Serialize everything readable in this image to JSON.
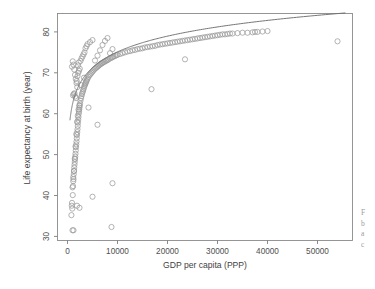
{
  "figure": {
    "background_color": "#ffffff",
    "point_color": "#9a9a9a",
    "curve_color": "#6f6f6f",
    "axis_color": "#7d7d7d"
  },
  "caption_fragment": {
    "line1": "F",
    "line2": "b",
    "line3": "a",
    "line4": "c"
  },
  "chart_data": {
    "type": "scatter",
    "title": "",
    "xlabel": "GDP per capita (PPP)",
    "ylabel": "Life expectancy at birth (year)",
    "xlim": [
      -2000,
      57000
    ],
    "ylim": [
      29,
      84.5
    ],
    "xticks": [
      0,
      10000,
      20000,
      30000,
      40000,
      50000
    ],
    "xtick_labels": [
      "0",
      "10000",
      "20000",
      "30000",
      "40000",
      "50000"
    ],
    "yticks": [
      30,
      40,
      50,
      60,
      70,
      80
    ],
    "ytick_labels": [
      "30",
      "40",
      "50",
      "60",
      "70",
      "80"
    ],
    "grid": false,
    "legend": null,
    "marker": "open-circle",
    "marker_size": 2.6,
    "series": [
      {
        "name": "Countries",
        "x": [
          780,
          850,
          900,
          950,
          1000,
          1050,
          1100,
          1150,
          1200,
          1250,
          1300,
          1350,
          1400,
          1450,
          1500,
          1550,
          1600,
          1650,
          1700,
          1750,
          1800,
          1850,
          1900,
          1950,
          2000,
          2050,
          2100,
          2150,
          2200,
          2250,
          2300,
          2350,
          2400,
          2450,
          2500,
          2600,
          2700,
          2800,
          2900,
          3000,
          3100,
          3200,
          3300,
          3400,
          3500,
          3600,
          3700,
          3800,
          3900,
          4000,
          4200,
          4400,
          4600,
          4800,
          5000,
          5200,
          5400,
          5600,
          5800,
          6000,
          6200,
          6400,
          6600,
          6800,
          7000,
          7200,
          7400,
          7600,
          7800,
          8000,
          8200,
          8500,
          8800,
          9000,
          9200,
          9500,
          9800,
          10000,
          10500,
          11000,
          11500,
          12000,
          12500,
          13000,
          13500,
          14000,
          14500,
          15000,
          15500,
          16000,
          16500,
          17000,
          17500,
          18000,
          18500,
          19000,
          19500,
          20000,
          20500,
          21000,
          21500,
          22000,
          22500,
          23000,
          23500,
          24000,
          24500,
          25000,
          25500,
          26000,
          26500,
          27000,
          27500,
          28000,
          28500,
          29000,
          29500,
          30000,
          30500,
          31000,
          31500,
          32000,
          32500,
          33000,
          34000,
          35000,
          36000,
          37000,
          37500,
          38000,
          39000,
          40000,
          54000,
          1100,
          1250,
          1400,
          1550,
          1700,
          1850,
          2000,
          2150,
          2300,
          2450,
          1000,
          1150,
          1300,
          1450,
          1600,
          1750,
          1900,
          2050,
          2200,
          2350,
          900,
          1050,
          1200,
          1350,
          1500,
          1650,
          1800,
          1950,
          2100,
          2250,
          2600,
          2800,
          3000,
          3200,
          3400,
          3600,
          3800,
          4000,
          4500,
          5000,
          5500,
          6000,
          6500,
          7000,
          7500,
          8000,
          8500,
          9000,
          1200,
          8800,
          5000,
          9000,
          16800,
          23500,
          6000,
          4200,
          2700,
          3300,
          2400,
          1900
        ],
        "y": [
          35.2,
          37.5,
          38.2,
          36.8,
          31.5,
          40.1,
          42.3,
          43.5,
          44.0,
          45.2,
          46.0,
          46.8,
          47.5,
          48.2,
          48.9,
          49.5,
          50.2,
          51.0,
          51.8,
          52.5,
          53.2,
          54.0,
          54.8,
          55.5,
          56.2,
          57.0,
          57.8,
          58.5,
          59.2,
          60.0,
          60.5,
          61.0,
          61.5,
          62.0,
          62.5,
          63.2,
          63.8,
          64.3,
          64.8,
          65.2,
          65.6,
          66.0,
          66.4,
          66.8,
          67.1,
          67.4,
          67.7,
          68.0,
          68.3,
          68.6,
          69.0,
          69.4,
          69.7,
          70.0,
          70.3,
          70.6,
          70.9,
          71.1,
          71.3,
          71.5,
          71.7,
          71.9,
          72.1,
          72.3,
          72.4,
          72.6,
          72.7,
          72.9,
          73.0,
          73.1,
          73.3,
          73.5,
          73.7,
          73.8,
          74.0,
          74.1,
          74.3,
          74.4,
          74.6,
          74.8,
          75.0,
          75.2,
          75.3,
          75.5,
          75.6,
          75.8,
          75.9,
          76.0,
          76.2,
          76.3,
          76.4,
          76.5,
          76.6,
          76.8,
          76.9,
          77.0,
          77.1,
          77.2,
          77.3,
          77.4,
          77.5,
          77.6,
          77.7,
          77.8,
          77.9,
          78.0,
          78.1,
          78.2,
          78.3,
          78.4,
          78.5,
          78.6,
          78.7,
          78.8,
          78.9,
          79.0,
          79.1,
          79.2,
          79.3,
          79.4,
          79.4,
          79.5,
          79.6,
          79.6,
          79.7,
          79.8,
          79.8,
          79.9,
          80.0,
          80.0,
          80.1,
          80.2,
          77.7,
          64.5,
          64.8,
          65.0,
          64.2,
          63.8,
          68.0,
          69.2,
          70.0,
          70.5,
          71.0,
          42.0,
          44.5,
          46.0,
          49.0,
          52.0,
          55.0,
          58.0,
          59.5,
          61.0,
          62.0,
          71.5,
          72.8,
          72.0,
          70.8,
          69.5,
          68.5,
          67.5,
          66.5,
          71.8,
          72.5,
          72.9,
          73.5,
          74.0,
          74.5,
          75.0,
          76.0,
          76.5,
          77.0,
          77.5,
          78.0,
          73.0,
          74.2,
          75.5,
          76.8,
          77.8,
          78.5,
          74.8,
          75.8,
          31.5,
          32.3,
          39.7,
          43.0,
          66.0,
          73.3,
          57.3,
          61.5,
          67.0,
          68.8,
          37.0,
          37.5
        ]
      }
    ],
    "fit": {
      "name": "log-fit",
      "description": "y = a + b * log(x)",
      "a": 24.0,
      "b": 5.55,
      "x_start": 500,
      "x_end": 55500
    },
    "annotations": []
  }
}
